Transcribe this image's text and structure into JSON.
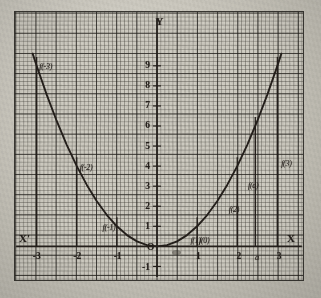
{
  "figure": {
    "axis_labels": {
      "x_positive": "X",
      "x_negative": "X'",
      "y_positive": "Y",
      "origin": "O"
    },
    "function_labels": [
      {
        "text": "f(-3)",
        "x": -3,
        "y": 9
      },
      {
        "text": "f(-2)",
        "x": -2,
        "y": 4
      },
      {
        "text": "f(-1)",
        "x": -1,
        "y": 1
      },
      {
        "text": "f(0)",
        "x": 0,
        "y": 0
      },
      {
        "text": "f(1)",
        "x": 1,
        "y": 1
      },
      {
        "text": "f(2)",
        "x": 2,
        "y": 4
      },
      {
        "text": "f(a)",
        "x": 2.45,
        "y": 6
      },
      {
        "text": "f(3)",
        "x": 3,
        "y": 9
      }
    ],
    "colors": {
      "ink": "#241f1b",
      "grid_fine": "#3c3a34",
      "grid_coarse": "#232119",
      "paper": "#cfccc2"
    }
  },
  "chart_data": {
    "type": "line",
    "title": "",
    "subtitle": "",
    "xlabel": "X",
    "ylabel": "Y",
    "function": "y = x^2",
    "xlim": [
      -3.6,
      3.6
    ],
    "ylim": [
      -1.4,
      10.2
    ],
    "grid": true,
    "legend_position": "none",
    "x_ticks": [
      -3,
      -2,
      -1,
      0,
      1,
      2,
      3
    ],
    "x_tick_labels": [
      "-3",
      "-2",
      "-1",
      "O",
      "1",
      "2",
      "3"
    ],
    "extra_x_ticks": [
      {
        "value": 2.45,
        "label": "a"
      }
    ],
    "y_ticks": [
      -1,
      0,
      1,
      2,
      3,
      4,
      5,
      6,
      7,
      8,
      9
    ],
    "y_tick_labels": [
      "-1",
      "O",
      "1",
      "2",
      "3",
      "4",
      "5",
      "6",
      "7",
      "8",
      "9"
    ],
    "series": [
      {
        "name": "y = x^2",
        "x": [
          -3.1,
          -3,
          -2.75,
          -2.5,
          -2.25,
          -2,
          -1.75,
          -1.5,
          -1.25,
          -1,
          -0.75,
          -0.5,
          -0.25,
          0,
          0.25,
          0.5,
          0.75,
          1,
          1.25,
          1.5,
          1.75,
          2,
          2.25,
          2.5,
          2.75,
          3,
          3.1
        ],
        "values": [
          9.61,
          9,
          7.5625,
          6.25,
          5.0625,
          4,
          3.0625,
          2.25,
          1.5625,
          1,
          0.5625,
          0.25,
          0.0625,
          0,
          0.0625,
          0.25,
          0.5625,
          1,
          1.5625,
          2.25,
          3.0625,
          4,
          5.0625,
          6.25,
          7.5625,
          9,
          9.61
        ]
      }
    ],
    "ordinate_lines": [
      {
        "x": -3,
        "y": 9
      },
      {
        "x": -2,
        "y": 4
      },
      {
        "x": -1,
        "y": 1
      },
      {
        "x": 1,
        "y": 1
      },
      {
        "x": 2,
        "y": 4
      },
      {
        "x": 2.45,
        "y": 6.0025
      },
      {
        "x": 3,
        "y": 9
      }
    ]
  }
}
